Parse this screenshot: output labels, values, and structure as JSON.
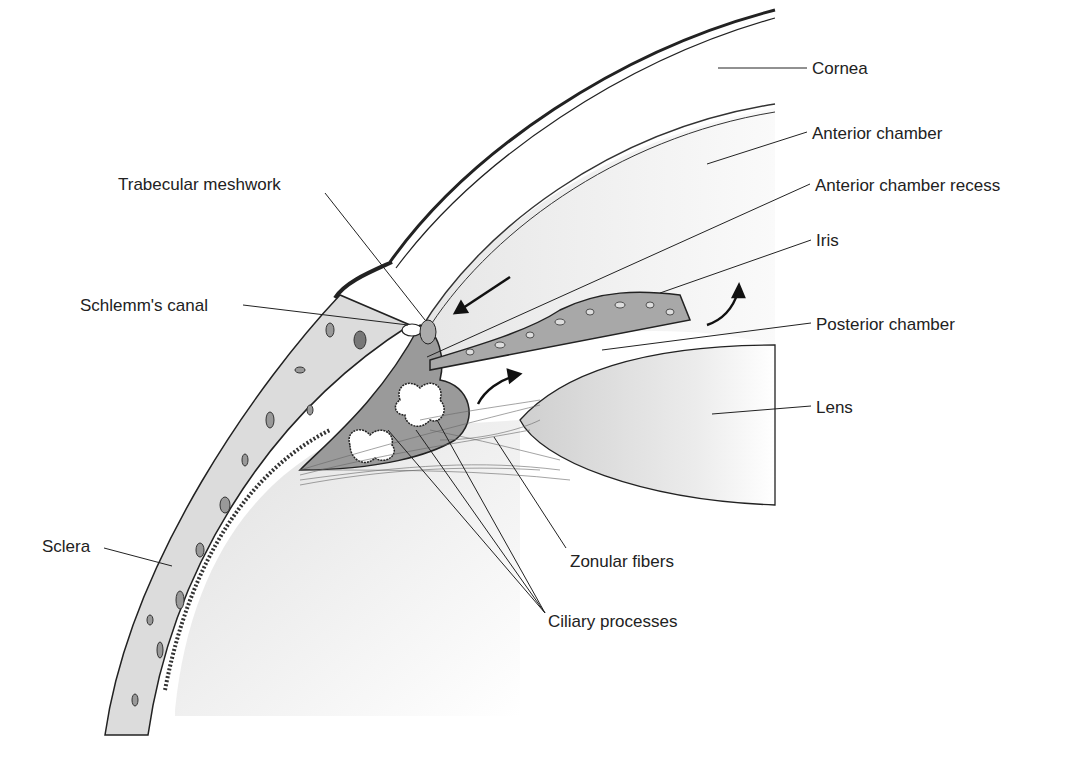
{
  "figure": {
    "labels": {
      "cornea": "Cornea",
      "anterior_chamber": "Anterior chamber",
      "anterior_chamber_recess": "Anterior chamber recess",
      "iris": "Iris",
      "posterior_chamber": "Posterior chamber",
      "lens": "Lens",
      "trabecular_meshwork": "Trabecular meshwork",
      "schlemms_canal": "Schlemm's canal",
      "sclera": "Sclera",
      "zonular_fibers": "Zonular fibers",
      "ciliary_processes": "Ciliary processes"
    },
    "colors": {
      "line": "#222222",
      "tissue_fill": "#d9d9d9",
      "chamber_fill": "#ececec",
      "dark_tissue": "#6f6f6f"
    }
  }
}
